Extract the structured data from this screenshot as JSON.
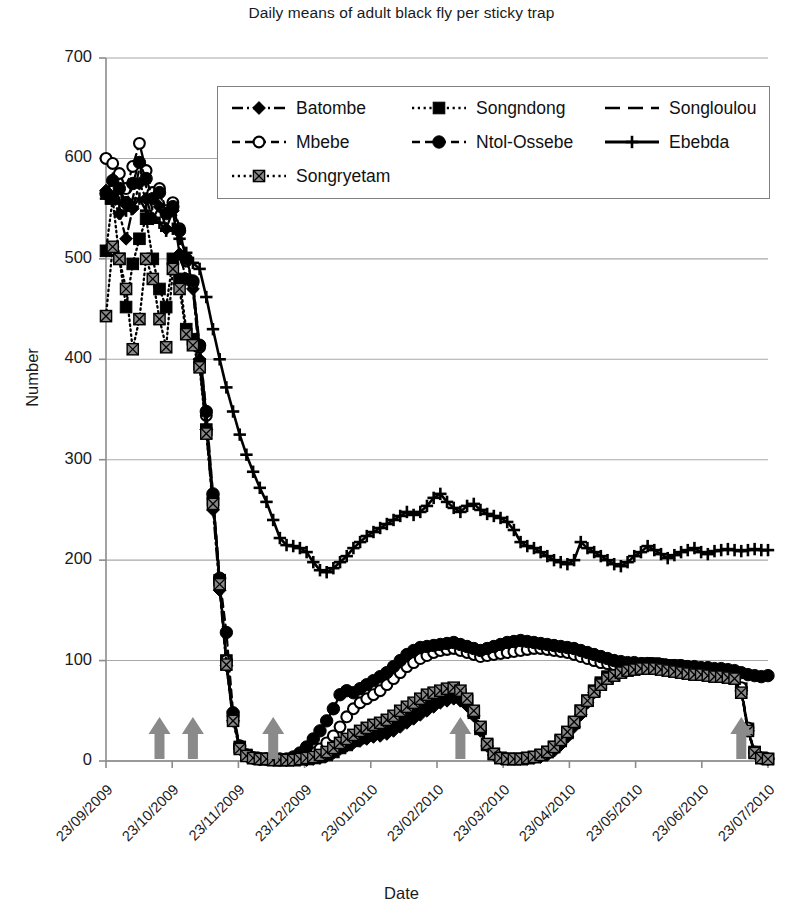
{
  "chart_data": {
    "type": "line",
    "title": "Daily means of adult black fly per sticky trap",
    "xlabel": "Date",
    "ylabel": "Number",
    "ylim": [
      0,
      700
    ],
    "ytick_labels": [
      "0",
      "100",
      "200",
      "300",
      "400",
      "500",
      "600",
      "700"
    ],
    "ytick_values": [
      0,
      100,
      200,
      300,
      400,
      500,
      600,
      700
    ],
    "grid": "horizontal",
    "legend_position": "top-center-inside",
    "xtick_labels": [
      "23/09/2009",
      "23/10/2009",
      "23/11/2009",
      "23/12/2009",
      "23/01/2010",
      "23/02/2010",
      "23/03/2010",
      "23/04/2010",
      "23/05/2010",
      "23/06/2010",
      "23/07/2010"
    ],
    "x_index": [
      0,
      1,
      2,
      3,
      4,
      5,
      6,
      7,
      8,
      9,
      10,
      11,
      12,
      13,
      14,
      15,
      16,
      17,
      18,
      19,
      20,
      21,
      22,
      23,
      24,
      25,
      26,
      27,
      28,
      29,
      30,
      31,
      32,
      33,
      34,
      35,
      36,
      37,
      38,
      39,
      40,
      41,
      42,
      43,
      44,
      45,
      46,
      47,
      48,
      49,
      50,
      51,
      52,
      53,
      54,
      55,
      56,
      57,
      58,
      59,
      60,
      61,
      62,
      63,
      64,
      65,
      66,
      67,
      68,
      69,
      70,
      71,
      72,
      73,
      74,
      75,
      76,
      77,
      78,
      79,
      80,
      81,
      82,
      83,
      84,
      85,
      86,
      87,
      88,
      89,
      90,
      91,
      92,
      93,
      94,
      95,
      96,
      97,
      98,
      99
    ],
    "series": [
      {
        "name": "Batombe",
        "marker": "diamond",
        "line": "dash-dot",
        "color": "#000000",
        "values": [
          568,
          560,
          545,
          520,
          550,
          575,
          560,
          540,
          552,
          530,
          548,
          505,
          480,
          470,
          400,
          330,
          250,
          170,
          95,
          40,
          12,
          5,
          3,
          2,
          2,
          1,
          1,
          1,
          1,
          1,
          1,
          2,
          3,
          5,
          8,
          12,
          15,
          18,
          20,
          22,
          24,
          25,
          27,
          30,
          34,
          38,
          42,
          46,
          50,
          54,
          58,
          60,
          62,
          60,
          55,
          45,
          30,
          15,
          6,
          3,
          2,
          2,
          2,
          2,
          3,
          4,
          6,
          10,
          16,
          24,
          34,
          46,
          58,
          68,
          76,
          82,
          86,
          88,
          90,
          92,
          93,
          94,
          94,
          93,
          92,
          92,
          91,
          90,
          90,
          89,
          89,
          88,
          88,
          88,
          86,
          70,
          30,
          8,
          3,
          2
        ]
      },
      {
        "name": "Songndong",
        "marker": "square-filled",
        "line": "dotted",
        "color": "#000000",
        "values": [
          508,
          560,
          500,
          452,
          495,
          520,
          540,
          500,
          470,
          452,
          500,
          480,
          430,
          420,
          395,
          330,
          260,
          180,
          100,
          44,
          14,
          6,
          3,
          2,
          2,
          1,
          1,
          1,
          1,
          2,
          2,
          3,
          4,
          6,
          9,
          13,
          16,
          20,
          23,
          26,
          28,
          30,
          33,
          36,
          40,
          44,
          48,
          52,
          56,
          60,
          64,
          66,
          68,
          66,
          60,
          48,
          32,
          16,
          7,
          3,
          2,
          2,
          2,
          3,
          4,
          6,
          9,
          14,
          20,
          28,
          38,
          50,
          60,
          70,
          78,
          84,
          88,
          91,
          93,
          95,
          96,
          97,
          97,
          96,
          95,
          95,
          94,
          93,
          92,
          92,
          91,
          90,
          90,
          89,
          87,
          72,
          32,
          9,
          3,
          2
        ]
      },
      {
        "name": "Songloulou",
        "marker": "none",
        "line": "long-dash",
        "color": "#000000",
        "values": [
          560,
          585,
          570,
          548,
          560,
          590,
          572,
          548,
          556,
          540,
          545,
          520,
          490,
          470,
          408,
          340,
          258,
          175,
          98,
          42,
          13,
          5,
          3,
          2,
          2,
          1,
          1,
          1,
          1,
          1,
          2,
          2,
          4,
          6,
          9,
          12,
          16,
          19,
          22,
          25,
          27,
          29,
          32,
          35,
          39,
          43,
          47,
          51,
          55,
          59,
          62,
          65,
          67,
          65,
          58,
          47,
          31,
          15,
          6,
          3,
          2,
          2,
          2,
          3,
          4,
          5,
          8,
          12,
          18,
          26,
          36,
          48,
          59,
          69,
          77,
          83,
          87,
          90,
          92,
          94,
          95,
          96,
          96,
          95,
          94,
          94,
          93,
          92,
          92,
          91,
          91,
          90,
          90,
          89,
          86,
          71,
          31,
          8,
          3,
          2
        ]
      },
      {
        "name": "Mbebe",
        "marker": "circle-open",
        "line": "dash",
        "color": "#000000",
        "values": [
          600,
          595,
          585,
          570,
          592,
          615,
          588,
          566,
          570,
          548,
          556,
          530,
          498,
          476,
          412,
          344,
          262,
          178,
          100,
          45,
          14,
          6,
          3,
          2,
          2,
          2,
          1,
          1,
          2,
          3,
          5,
          8,
          12,
          18,
          25,
          34,
          44,
          52,
          58,
          62,
          66,
          70,
          76,
          82,
          88,
          94,
          98,
          102,
          105,
          108,
          110,
          111,
          112,
          110,
          108,
          106,
          104,
          105,
          106,
          107,
          108,
          109,
          110,
          111,
          112,
          112,
          111,
          110,
          109,
          108,
          106,
          104,
          102,
          100,
          98,
          97,
          96,
          96,
          95,
          95,
          94,
          94,
          94,
          93,
          93,
          93,
          92,
          92,
          92,
          91,
          91,
          90,
          90,
          89,
          87,
          73,
          33,
          9,
          3,
          2
        ]
      },
      {
        "name": "Ntol-Ossebe",
        "marker": "circle-filled",
        "line": "dash",
        "color": "#000000",
        "values": [
          565,
          578,
          570,
          556,
          575,
          596,
          580,
          560,
          566,
          545,
          552,
          528,
          500,
          478,
          414,
          348,
          266,
          182,
          128,
          48,
          15,
          6,
          3,
          2,
          2,
          2,
          2,
          2,
          4,
          8,
          14,
          22,
          30,
          40,
          52,
          66,
          70,
          68,
          72,
          76,
          80,
          84,
          88,
          94,
          100,
          106,
          110,
          113,
          114,
          115,
          116,
          117,
          118,
          116,
          114,
          112,
          110,
          112,
          114,
          116,
          118,
          119,
          120,
          119,
          118,
          117,
          116,
          115,
          114,
          113,
          112,
          110,
          108,
          106,
          104,
          102,
          100,
          99,
          98,
          98,
          97,
          97,
          96,
          96,
          95,
          95,
          95,
          94,
          94,
          93,
          93,
          92,
          92,
          91,
          90,
          88,
          86,
          85,
          84,
          85
        ]
      },
      {
        "name": "Ebebda",
        "marker": "plus",
        "line": "solid",
        "color": "#000000",
        "values": [
          560,
          562,
          556,
          548,
          552,
          560,
          548,
          540,
          536,
          528,
          530,
          520,
          506,
          496,
          490,
          462,
          430,
          400,
          372,
          348,
          325,
          305,
          288,
          272,
          258,
          240,
          222,
          215,
          214,
          212,
          208,
          198,
          190,
          188,
          192,
          198,
          204,
          212,
          218,
          224,
          228,
          232,
          236,
          240,
          244,
          248,
          245,
          248,
          254,
          262,
          266,
          258,
          252,
          248,
          254,
          256,
          250,
          246,
          244,
          242,
          238,
          230,
          218,
          214,
          212,
          208,
          204,
          200,
          198,
          196,
          200,
          218,
          212,
          208,
          204,
          200,
          196,
          194,
          198,
          204,
          208,
          214,
          210,
          206,
          202,
          205,
          208,
          210,
          212,
          208,
          206,
          209,
          210,
          211,
          210,
          209,
          210,
          211,
          210,
          210
        ]
      },
      {
        "name": "Songryetam",
        "marker": "square-gray",
        "line": "dotted",
        "color": "#7a7a7a",
        "values": [
          443,
          512,
          500,
          470,
          410,
          440,
          500,
          480,
          440,
          412,
          490,
          470,
          425,
          414,
          392,
          326,
          256,
          176,
          96,
          40,
          12,
          5,
          3,
          2,
          2,
          1,
          1,
          1,
          1,
          2,
          3,
          4,
          6,
          9,
          13,
          18,
          22,
          26,
          30,
          33,
          36,
          38,
          41,
          45,
          50,
          54,
          58,
          62,
          66,
          68,
          70,
          72,
          73,
          70,
          62,
          50,
          34,
          17,
          7,
          3,
          2,
          2,
          2,
          3,
          4,
          6,
          9,
          14,
          21,
          29,
          39,
          50,
          60,
          69,
          76,
          82,
          85,
          88,
          90,
          91,
          92,
          92,
          92,
          91,
          90,
          89,
          88,
          87,
          86,
          86,
          85,
          84,
          84,
          83,
          82,
          68,
          30,
          8,
          3,
          2
        ]
      }
    ],
    "arrow_annotations": {
      "label": "treatment-arrow",
      "color": "#8a8a8a",
      "x_positions_index": [
        8,
        13,
        25,
        53,
        95
      ]
    }
  },
  "legend": {
    "entries": [
      {
        "label": "Batombe"
      },
      {
        "label": "Songndong"
      },
      {
        "label": "Songloulou"
      },
      {
        "label": "Mbebe"
      },
      {
        "label": "Ntol-Ossebe"
      },
      {
        "label": "Ebebda"
      },
      {
        "label": "Songryetam"
      }
    ]
  }
}
